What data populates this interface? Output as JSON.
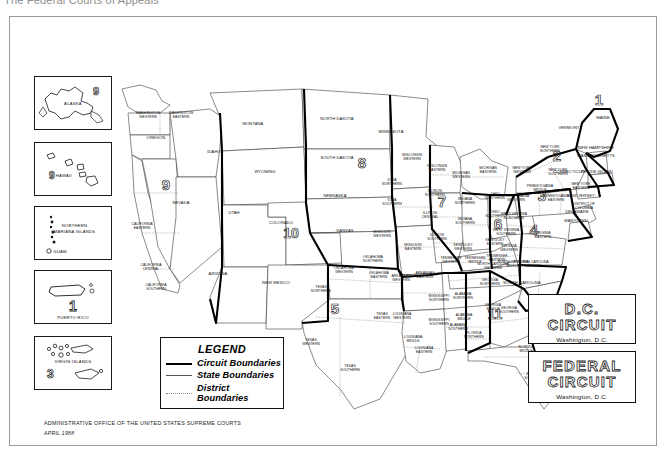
{
  "page": {
    "clipped_title": "The Federal Courts of Appeals",
    "credit_line1": "ADMINISTRATIVE OFFICE OF THE UNITED STATES SUPREME COURTS",
    "credit_line2": "APRIL 1988"
  },
  "legend": {
    "title": "LEGEND",
    "items": [
      {
        "label": "Circuit Boundaries",
        "key": "thick-solid-line"
      },
      {
        "label": "State Boundaries",
        "key": "thin-solid-line"
      },
      {
        "label": "District Boundaries",
        "key": "dotted-line"
      }
    ]
  },
  "insets": [
    {
      "name": "alaska",
      "label": "ALASKA",
      "circuit": "9"
    },
    {
      "name": "hawaii",
      "label": "HAWAII",
      "circuit": "9"
    },
    {
      "name": "northern-mariana-islands",
      "label": "NORTHERN MARIANA ISLANDS",
      "circuit": "9",
      "extra": "GUAM"
    },
    {
      "name": "puerto-rico",
      "label": "PUERTO RICO",
      "circuit": "1"
    },
    {
      "name": "virgin-islands",
      "label": "VIRGIN ISLANDS",
      "circuit": "3"
    }
  ],
  "side_boxes": [
    {
      "name": "dc-circuit",
      "line1": "D.C.",
      "line2": "CIRCUIT",
      "sub": "Washington, D.C."
    },
    {
      "name": "federal-circuit",
      "line1": "FEDERAL",
      "line2": "CIRCUIT",
      "sub": "Washington, D.C."
    }
  ],
  "circuit_numbers": [
    {
      "num": "1",
      "x": 598,
      "y": 104
    },
    {
      "num": "2",
      "x": 556,
      "y": 160
    },
    {
      "num": "3",
      "x": 541,
      "y": 200
    },
    {
      "num": "4",
      "x": 533,
      "y": 234
    },
    {
      "num": "5",
      "x": 334,
      "y": 313
    },
    {
      "num": "6",
      "x": 497,
      "y": 228
    },
    {
      "num": "7",
      "x": 441,
      "y": 206
    },
    {
      "num": "8",
      "x": 361,
      "y": 167
    },
    {
      "num": "9",
      "x": 165,
      "y": 189
    },
    {
      "num": "10",
      "x": 290,
      "y": 237
    },
    {
      "num": "11",
      "x": 494,
      "y": 318
    }
  ],
  "states": [
    {
      "name": "WASHINGTON WESTERN",
      "x": 147,
      "y": 113
    },
    {
      "name": "WASHINGTON EASTERN",
      "x": 180,
      "y": 113
    },
    {
      "name": "OREGON",
      "x": 155,
      "y": 138
    },
    {
      "name": "IDAHO",
      "x": 213,
      "y": 152
    },
    {
      "name": "MONTANA",
      "x": 252,
      "y": 124
    },
    {
      "name": "NORTH DAKOTA",
      "x": 336,
      "y": 119
    },
    {
      "name": "SOUTH DAKOTA",
      "x": 336,
      "y": 158
    },
    {
      "name": "NEBRASKA",
      "x": 334,
      "y": 196
    },
    {
      "name": "KANSAS",
      "x": 344,
      "y": 231
    },
    {
      "name": "MINNESOTA",
      "x": 390,
      "y": 132
    },
    {
      "name": "WYOMING",
      "x": 264,
      "y": 172
    },
    {
      "name": "NEVADA",
      "x": 180,
      "y": 203
    },
    {
      "name": "UTAH",
      "x": 233,
      "y": 213
    },
    {
      "name": "COLORADO",
      "x": 280,
      "y": 223
    },
    {
      "name": "ARIZONA",
      "x": 217,
      "y": 274
    },
    {
      "name": "NEW MEXICO",
      "x": 275,
      "y": 283
    },
    {
      "name": "CALIFORNIA EASTERN",
      "x": 141,
      "y": 224
    },
    {
      "name": "CALIFORNIA CENTRAL",
      "x": 150,
      "y": 265
    },
    {
      "name": "CALIFORNIA SOUTHERN",
      "x": 155,
      "y": 285
    },
    {
      "name": "TEXAS NORTHERN",
      "x": 320,
      "y": 287
    },
    {
      "name": "TEXAS WESTERN",
      "x": 310,
      "y": 340
    },
    {
      "name": "TEXAS EASTERN",
      "x": 381,
      "y": 314
    },
    {
      "name": "TEXAS SOUTHERN",
      "x": 349,
      "y": 366
    },
    {
      "name": "OKLAHOMA WESTERN",
      "x": 343,
      "y": 268
    },
    {
      "name": "OKLAHOMA NORTHERN",
      "x": 372,
      "y": 257
    },
    {
      "name": "OKLAHOMA EASTERN",
      "x": 378,
      "y": 273
    },
    {
      "name": "IOWA NORTHERN",
      "x": 391,
      "y": 180
    },
    {
      "name": "IOWA SOUTHERN",
      "x": 391,
      "y": 200
    },
    {
      "name": "MISSOURI WESTERN",
      "x": 381,
      "y": 232
    },
    {
      "name": "MISSOURI EASTERN",
      "x": 412,
      "y": 245
    },
    {
      "name": "ARKANSAS WESTERN",
      "x": 400,
      "y": 276
    },
    {
      "name": "ARKANSAS EASTERN",
      "x": 424,
      "y": 273
    },
    {
      "name": "LOUISIANA WESTERN",
      "x": 401,
      "y": 314
    },
    {
      "name": "LOUISIANA MIDDLE",
      "x": 412,
      "y": 337
    },
    {
      "name": "LOUISIANA EASTERN",
      "x": 423,
      "y": 348
    },
    {
      "name": "MISSISSIPPI NORTHERN",
      "x": 438,
      "y": 296
    },
    {
      "name": "MISSISSIPPI SOUTHERN",
      "x": 438,
      "y": 320
    },
    {
      "name": "WISCONSIN WESTERN",
      "x": 411,
      "y": 155
    },
    {
      "name": "WISCONSIN EASTERN",
      "x": 436,
      "y": 166
    },
    {
      "name": "ILLINOIS NORTHERN",
      "x": 434,
      "y": 191
    },
    {
      "name": "ILLINOIS CENTRAL",
      "x": 429,
      "y": 213
    },
    {
      "name": "ILLINOIS SOUTHERN",
      "x": 436,
      "y": 235
    },
    {
      "name": "INDIANA NORTHERN",
      "x": 464,
      "y": 199
    },
    {
      "name": "INDIANA SOUTHERN",
      "x": 464,
      "y": 219
    },
    {
      "name": "MICHIGAN WESTERN",
      "x": 460,
      "y": 173
    },
    {
      "name": "MICHIGAN EASTERN",
      "x": 487,
      "y": 168
    },
    {
      "name": "OHIO NORTHERN",
      "x": 494,
      "y": 194
    },
    {
      "name": "OHIO SOUTHERN",
      "x": 494,
      "y": 212
    },
    {
      "name": "KENTUCKY WESTERN",
      "x": 462,
      "y": 245
    },
    {
      "name": "KENTUCKY EASTERN",
      "x": 494,
      "y": 240
    },
    {
      "name": "TENNESSEE WESTERN",
      "x": 450,
      "y": 258
    },
    {
      "name": "TENNESSEE MIDDLE",
      "x": 474,
      "y": 258
    },
    {
      "name": "TENNESSEE EASTERN",
      "x": 496,
      "y": 256
    },
    {
      "name": "ALABAMA NORTHERN",
      "x": 462,
      "y": 294
    },
    {
      "name": "ALABAMA MIDDLE",
      "x": 463,
      "y": 315
    },
    {
      "name": "ALABAMA SOUTHERN",
      "x": 457,
      "y": 325
    },
    {
      "name": "GEORGIA NORTHERN",
      "x": 489,
      "y": 280
    },
    {
      "name": "GEORGIA MIDDLE",
      "x": 492,
      "y": 305
    },
    {
      "name": "GEORGIA SOUTHERN",
      "x": 508,
      "y": 308
    },
    {
      "name": "FLORIDA NORTHERN",
      "x": 473,
      "y": 333
    },
    {
      "name": "FLORIDA MIDDLE",
      "x": 525,
      "y": 347
    },
    {
      "name": "FLORIDA SOUTHERN",
      "x": 533,
      "y": 374
    },
    {
      "name": "SOUTH CAROLINA",
      "x": 521,
      "y": 283
    },
    {
      "name": "NORTH CAROLINA WESTERN",
      "x": 492,
      "y": 264
    },
    {
      "name": "NORTH CAROLINA MIDDLE",
      "x": 512,
      "y": 262
    },
    {
      "name": "NORTH CAROLINA EASTERN",
      "x": 532,
      "y": 262
    },
    {
      "name": "VIRGINIA WESTERN",
      "x": 508,
      "y": 246
    },
    {
      "name": "VIRGINIA EASTERN",
      "x": 542,
      "y": 233
    },
    {
      "name": "WEST VIRGINIA NORTHERN",
      "x": 513,
      "y": 214
    },
    {
      "name": "WEST VIRGINIA SOUTHERN",
      "x": 505,
      "y": 230
    },
    {
      "name": "PENNSYLVANIA WESTERN",
      "x": 515,
      "y": 196
    },
    {
      "name": "PENNSYLVANIA MIDDLE",
      "x": 539,
      "y": 186
    },
    {
      "name": "PENNSYLVANIA EASTERN",
      "x": 555,
      "y": 196
    },
    {
      "name": "NEW YORK NORTHERN",
      "x": 549,
      "y": 147
    },
    {
      "name": "NEW YORK WESTERN",
      "x": 521,
      "y": 168
    },
    {
      "name": "NEW YORK SOUTHERN",
      "x": 557,
      "y": 170
    },
    {
      "name": "NEW YORK EASTERN",
      "x": 580,
      "y": 184
    },
    {
      "name": "VERMONT",
      "x": 568,
      "y": 128
    },
    {
      "name": "MAINE",
      "x": 602,
      "y": 118
    },
    {
      "name": "NEW HAMPSHIRE",
      "x": 595,
      "y": 148
    },
    {
      "name": "MASSACHUSETTS",
      "x": 595,
      "y": 156
    },
    {
      "name": "RHODE ISLAND",
      "x": 596,
      "y": 172
    },
    {
      "name": "CONNECTICUT",
      "x": 568,
      "y": 172
    },
    {
      "name": "NEW JERSEY",
      "x": 580,
      "y": 196
    },
    {
      "name": "DISTRICT OF COLUMBIA",
      "x": 583,
      "y": 204
    },
    {
      "name": "DELAWARE",
      "x": 576,
      "y": 212
    },
    {
      "name": "MARYLAND",
      "x": 575,
      "y": 221
    }
  ]
}
